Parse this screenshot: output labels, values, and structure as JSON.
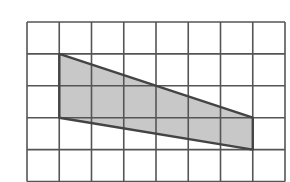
{
  "figure": {
    "type": "grid-with-shaded-quadrilateral",
    "grid": {
      "columns": 8,
      "rows": 5,
      "origin_px": [
        27,
        22
      ],
      "cell_w": 32.25,
      "cell_h": 31.9,
      "line_color": "#555555"
    },
    "shape": {
      "name": "trapezoid",
      "vertices_grid": [
        [
          1,
          1
        ],
        [
          7,
          3
        ],
        [
          7,
          4
        ],
        [
          1,
          3
        ]
      ],
      "fill": "#c8c8c8",
      "stroke": "#444444"
    }
  }
}
